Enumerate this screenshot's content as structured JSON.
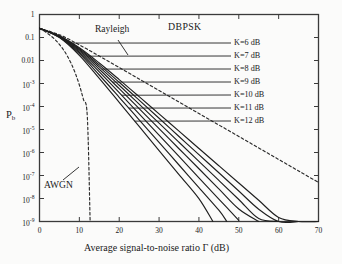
{
  "chart_data": {
    "type": "line",
    "title": "DBPSK",
    "xlabel": "Average signal-to-noise ratio Γ (dB)",
    "ylabel": "P_b",
    "xlim": [
      0,
      70
    ],
    "ylim": [
      1e-09,
      1
    ],
    "yscale": "log",
    "grid": false,
    "legend_position": "inline-right-annotations",
    "xticks": [
      0,
      10,
      20,
      30,
      40,
      50,
      60,
      70
    ],
    "xtick_labels": [
      "0",
      "10",
      "20",
      "30",
      "40",
      "50",
      "60",
      "70"
    ],
    "ytick_values": [
      1,
      0.1,
      0.01,
      0.001,
      0.0001,
      1e-05,
      1e-06,
      1e-07,
      1e-08,
      1e-09
    ],
    "ytick_labels": [
      "1",
      "0.1",
      "0.01",
      "10",
      "10",
      "10",
      "10",
      "10",
      "10",
      "10"
    ],
    "ytick_exponents": [
      "",
      "",
      "",
      "-3",
      "-4",
      "-5",
      "-6",
      "-7",
      "-8",
      "-9"
    ],
    "annotations": [
      {
        "name": "title-annotation",
        "text": "DBPSK",
        "x_px": 175,
        "y_px": 28
      },
      {
        "name": "rayleigh-annotation",
        "text": "Rayleigh",
        "x_px": 101,
        "y_px": 30
      },
      {
        "name": "awgn-annotation",
        "text": "AWGN",
        "x_px": 47,
        "y_px": 186
      }
    ],
    "series": [
      {
        "name": "AWGN",
        "label": "AWGN",
        "style": "dashed",
        "color": "#2b2b2b",
        "x": [
          0,
          1,
          2,
          3,
          4,
          5,
          6,
          7,
          8,
          9,
          10,
          11,
          12,
          12.7
        ],
        "y": [
          0.25,
          0.198,
          0.152,
          0.112,
          0.0777,
          0.0501,
          0.0294,
          0.01545,
          0.00708,
          0.00274,
          0.000861,
          0.000208,
          3.57e-05,
          1e-09
        ]
      },
      {
        "name": "Rayleigh",
        "label": "Rayleigh",
        "style": "dashed",
        "color": "#2b2b2b",
        "x": [
          0,
          5,
          10,
          15,
          20,
          25,
          30,
          35,
          40,
          45,
          50,
          55,
          60,
          65,
          70
        ],
        "y": [
          0.25,
          0.1318,
          0.0476,
          0.01555,
          0.00498,
          0.001577,
          0.0004988,
          0.0001577,
          4.988e-05,
          1.577e-05,
          4.988e-06,
          1.577e-06,
          4.988e-07,
          1.577e-07,
          5e-08
        ]
      },
      {
        "name": "K=6 dB",
        "label": "K=6 dB",
        "style": "solid",
        "color": "#1f1f1f",
        "x": [
          0,
          5,
          10,
          15,
          20,
          25,
          30,
          35,
          40,
          45,
          50,
          55,
          60,
          65,
          70
        ],
        "y": [
          0.25,
          0.118,
          0.0355,
          0.00776,
          0.00148,
          0.000268,
          4.77e-05,
          8.45e-06,
          1.5e-06,
          2.66e-07,
          4.72e-08,
          8.4e-09,
          1.5e-09,
          2.7e-10,
          5e-11
        ]
      },
      {
        "name": "K=7 dB",
        "label": "K=7 dB",
        "style": "solid",
        "color": "#1f1f1f",
        "x": [
          0,
          5,
          10,
          15,
          20,
          25,
          30,
          35,
          40,
          45,
          50,
          55,
          60,
          65
        ],
        "y": [
          0.25,
          0.115,
          0.0324,
          0.00646,
          0.00113,
          0.000188,
          3.07e-05,
          4.98e-06,
          8.07e-07,
          1.31e-07,
          2.12e-08,
          3.43e-09,
          5.56e-10,
          9e-11
        ]
      },
      {
        "name": "K=8 dB",
        "label": "K=8 dB",
        "style": "solid",
        "color": "#1f1f1f",
        "x": [
          0,
          5,
          10,
          15,
          20,
          25,
          30,
          35,
          40,
          45,
          50,
          55,
          60
        ],
        "y": [
          0.25,
          0.112,
          0.0293,
          0.00528,
          0.000838,
          0.000127,
          1.89e-05,
          2.8e-06,
          4.14e-07,
          6.12e-08,
          9.05e-09,
          1.34e-09,
          2e-10
        ]
      },
      {
        "name": "K=9 dB",
        "label": "K=9 dB",
        "style": "solid",
        "color": "#1f1f1f",
        "x": [
          0,
          5,
          10,
          15,
          20,
          25,
          30,
          35,
          40,
          45,
          50,
          55
        ],
        "y": [
          0.25,
          0.109,
          0.0261,
          0.00418,
          0.000594,
          8.11e-05,
          1.09e-05,
          1.46e-06,
          1.96e-07,
          2.62e-08,
          3.5e-09,
          4.7e-10
        ]
      },
      {
        "name": "K=10 dB",
        "label": "K=10 dB",
        "style": "solid",
        "color": "#1f1f1f",
        "x": [
          0,
          5,
          10,
          15,
          20,
          25,
          30,
          35,
          40,
          45,
          50
        ],
        "y": [
          0.25,
          0.106,
          0.0229,
          0.00319,
          0.000398,
          4.78e-05,
          5.68e-06,
          6.73e-07,
          7.97e-08,
          9.44e-09,
          1.12e-09
        ]
      },
      {
        "name": "K=11 dB",
        "label": "K=11 dB",
        "style": "solid",
        "color": "#1f1f1f",
        "x": [
          0,
          5,
          10,
          15,
          20,
          25,
          30,
          35,
          40,
          45,
          47
        ],
        "y": [
          0.25,
          0.103,
          0.0198,
          0.00234,
          0.000252,
          2.64e-05,
          2.75e-06,
          2.86e-07,
          2.97e-08,
          3.09e-09,
          1e-09
        ]
      },
      {
        "name": "K=12 dB",
        "label": "K=12 dB",
        "style": "solid",
        "color": "#1f1f1f",
        "x": [
          0,
          5,
          10,
          15,
          20,
          25,
          30,
          35,
          40,
          43.5
        ],
        "y": [
          0.25,
          0.0995,
          0.0168,
          0.00166,
          0.000151,
          1.36e-05,
          1.22e-06,
          1.1e-07,
          9.9e-09,
          1e-09
        ]
      }
    ]
  },
  "axes": {
    "ylabel_base": "P",
    "ylabel_sub": "b",
    "xlabel": "Average signal-to-noise ratio Γ (dB)"
  },
  "series_labels": [
    {
      "text": "K=6 dB",
      "x_px": 234,
      "y_px": 39
    },
    {
      "text": "K=7 dB",
      "x_px": 234,
      "y_px": 52
    },
    {
      "text": "K=8 dB",
      "x_px": 234,
      "y_px": 65
    },
    {
      "text": "K=9 dB",
      "x_px": 234,
      "y_px": 78
    },
    {
      "text": "K=10 dB",
      "x_px": 234,
      "y_px": 91
    },
    {
      "text": "K=11 dB",
      "x_px": 234,
      "y_px": 104
    },
    {
      "text": "K=12 dB",
      "x_px": 234,
      "y_px": 117
    }
  ],
  "ytick_labels_render": [
    {
      "mantissa": "1",
      "exp": ""
    },
    {
      "mantissa": "0.1",
      "exp": ""
    },
    {
      "mantissa": "0.01",
      "exp": ""
    },
    {
      "mantissa": "10",
      "exp": "-3"
    },
    {
      "mantissa": "10",
      "exp": "-4"
    },
    {
      "mantissa": "10",
      "exp": "-5"
    },
    {
      "mantissa": "10",
      "exp": "-6"
    },
    {
      "mantissa": "10",
      "exp": "-7"
    },
    {
      "mantissa": "10",
      "exp": "-8"
    },
    {
      "mantissa": "10",
      "exp": "-9"
    }
  ],
  "xtick_labels_render": [
    "0",
    "10",
    "20",
    "30",
    "40",
    "50",
    "60",
    "70"
  ],
  "colors": {
    "ink": "#1f1f1f",
    "frame": "#3a3a3a",
    "background": "#fbfbfa"
  }
}
